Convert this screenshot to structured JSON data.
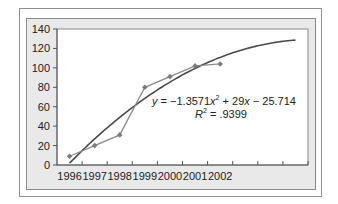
{
  "chart_data": {
    "type": "line",
    "title": "",
    "xlabel": "",
    "ylabel": "",
    "categories": [
      "1996",
      "1997",
      "1998",
      "1999",
      "2000",
      "2001",
      "2002",
      "",
      "",
      ""
    ],
    "series": [
      {
        "name": "Data",
        "type": "line-markers",
        "color": "#8a8a8a",
        "x": [
          "1996",
          "1997",
          "1998",
          "1999",
          "2000",
          "2001",
          "2002"
        ],
        "values": [
          9,
          20,
          31,
          80,
          91,
          102,
          104
        ]
      },
      {
        "name": "Polynomial trendline",
        "type": "trendline",
        "color": "#4a4a4a",
        "equation": "y = -1.3571x^2 + 29x - 25.714",
        "coefficients": {
          "a": -1.3571,
          "b": 29,
          "c": -25.714
        },
        "x_range": [
          1,
          10
        ],
        "r_squared": 0.9399
      }
    ],
    "ylim": [
      0,
      140
    ],
    "yticks": [
      0,
      20,
      40,
      60,
      80,
      100,
      120,
      140
    ],
    "grid": false,
    "legend": "none",
    "annotations": [
      {
        "text": "y = −1.3571x² + 29x − 25.714"
      },
      {
        "text": "R² = .9399"
      }
    ]
  },
  "labels": {
    "yticks": [
      "0",
      "20",
      "40",
      "60",
      "80",
      "100",
      "120",
      "140"
    ],
    "xticks": [
      "1996",
      "1997",
      "1998",
      "1999",
      "2000",
      "2001",
      "2002"
    ],
    "eq_y": "y",
    "eq_rest1": " = −1.3571",
    "eq_x1": "x",
    "eq_sup": "2",
    "eq_rest2": " + 29",
    "eq_x2": "x",
    "eq_rest3": " − 25.714",
    "r_label": "R",
    "r_sup": "2",
    "r_value": " = .9399"
  }
}
